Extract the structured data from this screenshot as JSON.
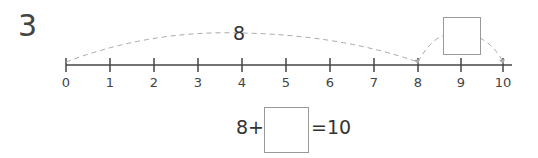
{
  "question": {
    "number": "3"
  },
  "number_line": {
    "start": 0,
    "end": 10,
    "ticks": [
      "0",
      "1",
      "2",
      "3",
      "4",
      "5",
      "6",
      "7",
      "8",
      "9",
      "10"
    ],
    "jump_label": "8",
    "jump_from": 0,
    "jump_to": 8,
    "second_jump_from": 8,
    "second_jump_to": 10,
    "second_jump_answer": ""
  },
  "equation": {
    "left": "8+",
    "blank": "",
    "right": "=10"
  },
  "colors": {
    "line": "#444444",
    "arc": "#aaaaaa",
    "box_border": "#999999"
  }
}
